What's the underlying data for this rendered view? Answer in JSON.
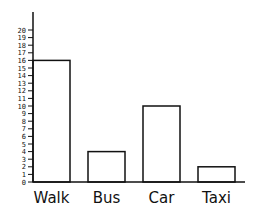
{
  "chart_data": {
    "type": "bar",
    "title": "",
    "xlabel": "",
    "ylabel": "",
    "categories": [
      "Walk",
      "Bus",
      "Car",
      "Taxi"
    ],
    "values": [
      16,
      4,
      10,
      2
    ],
    "ylim": [
      0,
      20
    ],
    "yticks": [
      0,
      1,
      2,
      3,
      4,
      5,
      6,
      7,
      8,
      9,
      10,
      11,
      12,
      13,
      14,
      15,
      16,
      17,
      18,
      19,
      20
    ],
    "grid": false,
    "legend": null,
    "bar_fill": "#ffffff",
    "bar_stroke": "#111111"
  }
}
